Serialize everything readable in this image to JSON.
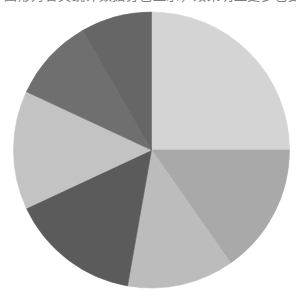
{
  "caption": {
    "text": "图形对各类统计数据分色显示，效果明显更多也更加准确"
  },
  "chart_data": {
    "type": "pie",
    "title": "",
    "subtitle": "",
    "xlabel": "",
    "ylabel": "",
    "grid": false,
    "legend": "none",
    "start_angle_deg": 0,
    "direction": "clockwise",
    "center": [
      151.5,
      150.0
    ],
    "radius": 138,
    "background": "#ffffff",
    "labels": [
      "Segment 1",
      "Segment 2",
      "Segment 3",
      "Segment 4",
      "Segment 5",
      "Segment 6",
      "Segment 7"
    ],
    "values": [
      25.0,
      15.3,
      12.5,
      15.3,
      13.9,
      9.7,
      8.3
    ],
    "percents": [
      "25.0%",
      "15.3%",
      "12.5%",
      "15.3%",
      "13.9%",
      "9.7%",
      "8.3%"
    ],
    "colors": [
      "#d4d4d4",
      "#a9a9a9",
      "#bcbcbc",
      "#5b5b5b",
      "#c3c3c3",
      "#6f6f6f",
      "#666666"
    ],
    "angles_deg": [
      [
        0,
        90
      ],
      [
        90,
        145
      ],
      [
        145,
        190
      ],
      [
        190,
        245
      ],
      [
        245,
        295
      ],
      [
        295,
        330
      ],
      [
        330,
        360
      ]
    ]
  }
}
